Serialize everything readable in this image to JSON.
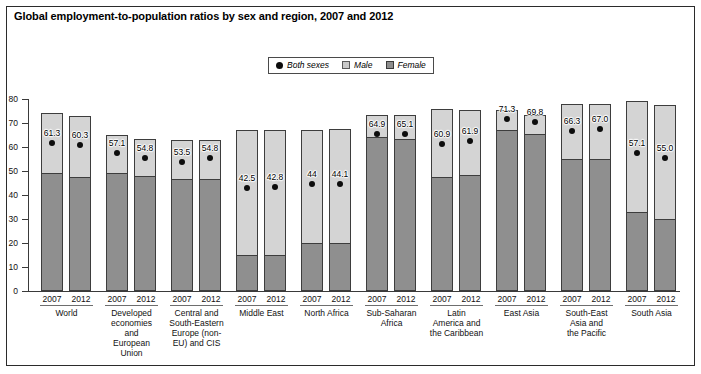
{
  "title": "Global employment-to-population ratios by sex and region, 2007 and 2012",
  "legend": {
    "both_sexes": "Both sexes",
    "male": "Male",
    "female": "Female",
    "both_sexes_icon": "filled-circle-marker",
    "male_icon": "light-gray-square-swatch",
    "female_icon": "dark-gray-square-swatch"
  },
  "colors": {
    "male_fill": "#d4d4d4",
    "female_fill": "#8f8f8f",
    "marker": "#0d0d0d",
    "axis": "#3a3a3a",
    "frame": "#2b2b2b"
  },
  "axis": {
    "y_ticks": [
      "0",
      "10",
      "20",
      "30",
      "40",
      "50",
      "60",
      "70",
      "80"
    ],
    "years": [
      "2007",
      "2012"
    ]
  },
  "chart_data": {
    "type": "bar",
    "title": "Global employment-to-population ratios by sex and region, 2007 and 2012",
    "xlabel": "",
    "ylabel": "",
    "ylim": [
      0,
      80
    ],
    "ytick_step": 10,
    "grid": false,
    "legend_position": "top-center",
    "note": "Each region has two bars (2007, 2012). Each bar is overlaid: the full bar height is the Male ratio, the dark lower segment is the Female ratio, and the dot label is the Both-sexes ratio.",
    "categories": [
      "World",
      "Developed economies and European Union",
      "Central and South-Eastern Europe (non-EU) and CIS",
      "Middle East",
      "North Africa",
      "Sub-Saharan Africa",
      "Latin America and the Caribbean",
      "East Asia",
      "South-East Asia and the Pacific",
      "South Asia"
    ],
    "series": [
      {
        "name": "Male",
        "values_2007": [
          74.0,
          65.0,
          63.0,
          67.0,
          67.0,
          73.5,
          76.0,
          75.5,
          78.0,
          79.0
        ],
        "values_2012": [
          73.0,
          63.5,
          63.0,
          67.0,
          67.5,
          73.5,
          75.5,
          73.5,
          78.0,
          77.5
        ]
      },
      {
        "name": "Female",
        "values_2007": [
          49.0,
          49.0,
          46.5,
          15.0,
          20.0,
          64.0,
          47.5,
          67.0,
          55.0,
          33.0
        ],
        "values_2012": [
          47.5,
          48.0,
          46.5,
          15.0,
          20.0,
          63.5,
          48.5,
          65.5,
          55.0,
          30.0
        ]
      },
      {
        "name": "Both sexes",
        "values_2007": [
          61.3,
          57.1,
          53.5,
          42.5,
          44.0,
          64.9,
          60.9,
          71.3,
          66.3,
          57.1
        ],
        "values_2012": [
          60.3,
          54.8,
          54.8,
          42.8,
          44.1,
          65.1,
          61.9,
          69.8,
          67.0,
          55.0
        ]
      }
    ],
    "both_sexes_labels": {
      "2007": [
        "61.3",
        "57.1",
        "53.5",
        "42.5",
        "44",
        "64.9",
        "60.9",
        "71.3",
        "66.3",
        "57.1"
      ],
      "2012": [
        "60.3",
        "54.8",
        "54.8",
        "42.8",
        "44.1",
        "65.1",
        "61.9",
        "69.8",
        "67.0",
        "55.0"
      ]
    }
  },
  "regions": [
    {
      "name": "World",
      "lines": [
        "World"
      ]
    },
    {
      "name": "Developed economies and European Union",
      "lines": [
        "Developed",
        "economies",
        "and",
        "European",
        "Union"
      ]
    },
    {
      "name": "Central and South-Eastern Europe (non-EU) and CIS",
      "lines": [
        "Central and",
        "South-Eastern",
        "Europe (non-",
        "EU) and CIS"
      ]
    },
    {
      "name": "Middle East",
      "lines": [
        "Middle East"
      ]
    },
    {
      "name": "North Africa",
      "lines": [
        "North Africa"
      ]
    },
    {
      "name": "Sub-Saharan Africa",
      "lines": [
        "Sub-Saharan",
        "Africa"
      ]
    },
    {
      "name": "Latin America and the Caribbean",
      "lines": [
        "Latin",
        "America and",
        "the Caribbean"
      ]
    },
    {
      "name": "East Asia",
      "lines": [
        "East Asia"
      ]
    },
    {
      "name": "South-East Asia and the Pacific",
      "lines": [
        "South-East",
        "Asia and",
        "the Pacific"
      ]
    },
    {
      "name": "South Asia",
      "lines": [
        "South Asia"
      ]
    }
  ]
}
